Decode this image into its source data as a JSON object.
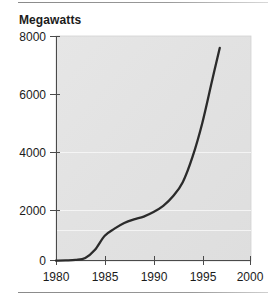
{
  "figure": {
    "title": "Megawatts",
    "background": "#ffffff",
    "plot_background": "#e3e3e3",
    "line_color": "#2b2b2b",
    "text_color": "#1b1b1b",
    "rule_color": "#8a8a8a",
    "gridline_color": "#f4f4f4"
  },
  "chart_data": {
    "type": "line",
    "title": "Megawatts",
    "xlabel": "",
    "ylabel": "Megawatts",
    "xlim": [
      1980,
      2000
    ],
    "ylim": [
      0,
      8000
    ],
    "grid": true,
    "legend": null,
    "x_ticks": [
      "1980",
      "1985",
      "1990",
      "1995",
      "2000"
    ],
    "x_tick_values": [
      1980,
      1985,
      1990,
      1995,
      2000
    ],
    "y_ticks": [
      "0",
      "2000",
      "4000",
      "6000",
      "8000"
    ],
    "y_tick_values": [
      0,
      2000,
      4000,
      6000,
      8000
    ],
    "series": [
      {
        "name": "Installed wind capacity",
        "x": [
          1980,
          1981,
          1982,
          1983,
          1984,
          1985,
          1986,
          1987,
          1988,
          1989,
          1990,
          1991,
          1992,
          1993,
          1994,
          1995,
          1996,
          1996.8
        ],
        "values": [
          10,
          20,
          40,
          110,
          400,
          900,
          1150,
          1350,
          1480,
          1580,
          1740,
          1960,
          2300,
          2800,
          3700,
          4900,
          6400,
          7580
        ]
      }
    ],
    "annotations": []
  },
  "axes": {
    "y_labels": [
      "8000",
      "6000",
      "4000",
      "2000",
      "0"
    ],
    "x_labels": [
      "1980",
      "1985",
      "1990",
      "1995",
      "2000"
    ]
  }
}
